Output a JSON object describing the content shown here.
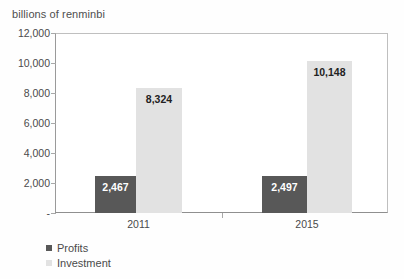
{
  "chart_data": {
    "type": "bar",
    "title": "billions of renminbi",
    "subtitle": "",
    "xlabel": "",
    "ylabel": "",
    "categories": [
      "2011",
      "2015"
    ],
    "series": [
      {
        "name": "Profits",
        "color": "#585858",
        "values": [
          2467,
          2497
        ],
        "value_labels": [
          "2,467",
          "2,497"
        ]
      },
      {
        "name": "Investment",
        "color": "#e2e2e2",
        "values": [
          8324,
          10148
        ],
        "value_labels": [
          "8,324",
          "10,148"
        ]
      }
    ],
    "ylim": [
      0,
      12000
    ],
    "ytick_values": [
      12000,
      10000,
      8000,
      6000,
      4000,
      2000,
      0
    ],
    "ytick_labels": [
      "12,000",
      "10,000",
      "8,000",
      "6,000",
      "4,000",
      "2,000",
      "-"
    ],
    "grid": false,
    "legend_position": "bottom-left",
    "legend_entries": [
      "Profits",
      "Investment"
    ]
  },
  "legend": {
    "items": [
      {
        "label": "Profits"
      },
      {
        "label": "Investment"
      }
    ]
  }
}
